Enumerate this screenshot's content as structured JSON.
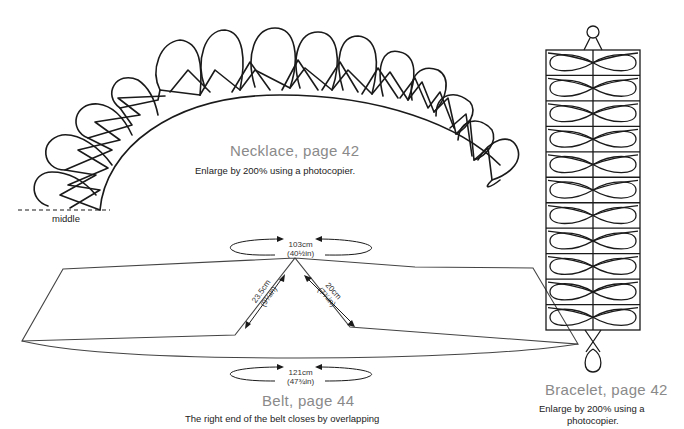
{
  "necklace": {
    "title": "Necklace, page 42",
    "note": "Enlarge by 200% using a photocopier.",
    "middle_label": "middle"
  },
  "belt": {
    "title": "Belt, page 44",
    "note": "The right end of the belt closes by overlapping",
    "dims": {
      "top": {
        "cm": "103cm",
        "in": "(40½in)"
      },
      "bottom": {
        "cm": "121cm",
        "in": "(47¾in)"
      },
      "left_diag": {
        "cm": "23.5cm",
        "in": "(9¼in)"
      },
      "right_diag": {
        "cm": "20cm",
        "in": "(7¾in)"
      }
    }
  },
  "bracelet": {
    "title": "Bracelet, page 42",
    "note_line1": "Enlarge by 200% using a",
    "note_line2": "photocopier.",
    "rows": 11
  },
  "colors": {
    "line": "#1a1a1a",
    "title": "#8a8a8a",
    "background": "#ffffff"
  }
}
